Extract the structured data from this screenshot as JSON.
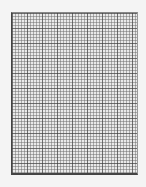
{
  "page": {
    "colors": {
      "background": "#f4f4f4",
      "grid_minor": "#9a9a9a",
      "grid_major": "#555555"
    }
  }
}
